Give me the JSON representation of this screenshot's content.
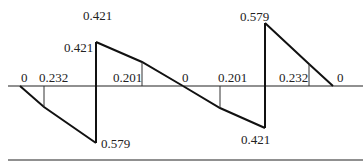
{
  "diagram": {
    "type": "shear-force-diagram",
    "colors": {
      "line": "#111111",
      "background": "#ffffff"
    },
    "labels": {
      "top_421": "0.421",
      "left_jump_421": "0.421",
      "bottom_579": "0.579",
      "top_579": "0.579",
      "bottom_421": "0.421",
      "zero_left": "0",
      "val_232_left": "0.232",
      "val_201_left": "0.201",
      "zero_mid": "0",
      "val_201_right": "0.201",
      "val_232_right": "0.232",
      "zero_right": "0"
    },
    "segments": [
      {
        "name": "span-1",
        "start": 0,
        "end": -0.579,
        "mid_value": 0.232
      },
      {
        "name": "span-2",
        "start": 0.421,
        "end": 0,
        "mid_value": 0.201
      },
      {
        "name": "span-3",
        "start": 0,
        "end": -0.421,
        "mid_value": 0.201
      },
      {
        "name": "span-4",
        "start": 0.579,
        "end": 0,
        "mid_value": 0.232
      }
    ]
  }
}
